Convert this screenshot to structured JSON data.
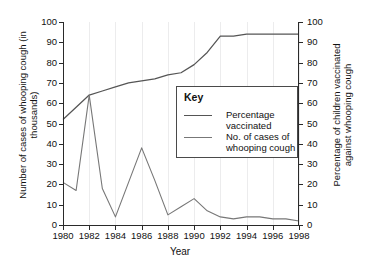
{
  "chart_data": {
    "type": "line",
    "title": "",
    "xlabel": "Year",
    "ylabel": "Number of cases of whooping cough (in thousands)",
    "ylabel_right": "Percentage of children vaccinated against whooping cough",
    "x": [
      1980,
      1981,
      1982,
      1983,
      1984,
      1985,
      1986,
      1987,
      1988,
      1989,
      1990,
      1991,
      1992,
      1993,
      1994,
      1995,
      1996,
      1997,
      1998
    ],
    "xlim": [
      1980,
      1998
    ],
    "ylim": [
      0,
      100
    ],
    "ylim_right": [
      0,
      100
    ],
    "xticks": [
      "1980",
      "1982",
      "1984",
      "1986",
      "1988",
      "1990",
      "1992",
      "1994",
      "1996",
      "1998"
    ],
    "yticks": [
      "0",
      "10",
      "20",
      "30",
      "40",
      "50",
      "60",
      "70",
      "80",
      "90",
      "100"
    ],
    "yticks_right": [
      "0",
      "10",
      "20",
      "30",
      "40",
      "50",
      "60",
      "70",
      "80",
      "90",
      "100"
    ],
    "grid": "vertical-only",
    "legend_position": "center-right-inside",
    "series": [
      {
        "name": "Percentage vaccinated",
        "color": "#555555",
        "values": [
          52,
          58,
          64,
          66,
          68,
          70,
          71,
          72,
          74,
          75,
          79,
          85,
          93,
          93,
          94,
          94,
          94,
          94,
          94
        ]
      },
      {
        "name": "No. of cases of whooping cough",
        "color": "#777777",
        "values": [
          21,
          17,
          64,
          18,
          4,
          21,
          38,
          22,
          5,
          9,
          13,
          7,
          4,
          3,
          4,
          4,
          3,
          3,
          2
        ]
      }
    ]
  },
  "legend": {
    "title": "Key",
    "entries": [
      {
        "label": "Percentage vaccinated"
      },
      {
        "label": "No. of cases of whooping cough"
      }
    ]
  },
  "axes": {
    "x_title": "Year",
    "y_left_title": "Number of cases of whooping cough (in thousands)",
    "y_right_title": "Percentage of children vaccinated against whooping cough"
  },
  "colors": {
    "background": "#ffffff",
    "axis": "#2a2a2a",
    "gridline": "#ececed",
    "line_vaccination": "#555555",
    "line_cases": "#777777",
    "text": "#111111"
  }
}
